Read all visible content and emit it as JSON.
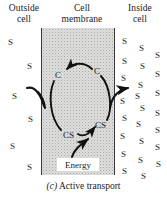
{
  "figure": {
    "caption_letter": "(c)",
    "caption_text": "Active transport",
    "background_color": "#ffffff"
  },
  "headers": {
    "outside": "Outside\ncell",
    "outside_line1": "Outside",
    "outside_line2": "cell",
    "membrane_line1": "Cell",
    "membrane_line2": "membrane",
    "inside_line1": "Inside",
    "inside_line2": "cell"
  },
  "membrane": {
    "fill_color": "#dededd",
    "border_color": "#3a3a3a",
    "x": 41,
    "y": 28,
    "width": 74,
    "height": 147
  },
  "labels": {
    "carrier": "C",
    "carrier_substrate": "CS",
    "energy": "Energy"
  },
  "cycle_nodes": [
    {
      "name": "carrier-top-left",
      "text": "C",
      "x": 55,
      "y": 71
    },
    {
      "name": "carrier-top-right",
      "text": "C",
      "x": 94,
      "y": 67
    },
    {
      "name": "carrier-substrate-bottom-left",
      "text": "CS",
      "x": 63,
      "y": 131
    },
    {
      "name": "carrier-substrate-bottom-right",
      "text": "CS",
      "x": 95,
      "y": 121
    }
  ],
  "solute_outside": [
    {
      "x": 8,
      "y": 38
    },
    {
      "x": 27,
      "y": 62
    },
    {
      "x": 12,
      "y": 92
    },
    {
      "x": 28,
      "y": 115
    },
    {
      "x": 10,
      "y": 142
    },
    {
      "x": 27,
      "y": 163
    }
  ],
  "solute_inside": [
    {
      "x": 122,
      "y": 37
    },
    {
      "x": 139,
      "y": 44
    },
    {
      "x": 155,
      "y": 51
    },
    {
      "x": 122,
      "y": 57
    },
    {
      "x": 140,
      "y": 62
    },
    {
      "x": 155,
      "y": 70
    },
    {
      "x": 121,
      "y": 74
    },
    {
      "x": 138,
      "y": 81
    },
    {
      "x": 155,
      "y": 89
    },
    {
      "x": 135,
      "y": 92
    },
    {
      "x": 120,
      "y": 97
    },
    {
      "x": 140,
      "y": 104
    },
    {
      "x": 155,
      "y": 109
    },
    {
      "x": 122,
      "y": 114
    },
    {
      "x": 136,
      "y": 120
    },
    {
      "x": 155,
      "y": 126
    },
    {
      "x": 120,
      "y": 132
    },
    {
      "x": 139,
      "y": 137
    },
    {
      "x": 155,
      "y": 143
    },
    {
      "x": 121,
      "y": 150
    },
    {
      "x": 138,
      "y": 156
    },
    {
      "x": 156,
      "y": 160
    },
    {
      "x": 122,
      "y": 167
    },
    {
      "x": 141,
      "y": 172
    }
  ],
  "arrows": {
    "entry_label": "substrate-entry-arrow",
    "exit_label": "substrate-exit-arrow",
    "cycle_top_label": "carrier-return-arrow",
    "cycle_bottom_label": "carrier-transport-arrow",
    "energy_label": "energy-input-arrow",
    "color": "#111111"
  }
}
